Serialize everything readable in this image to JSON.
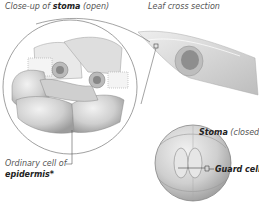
{
  "labels": {
    "closeup_prefix": "Close-up of ",
    "closeup_bold": "stoma",
    "closeup_suffix": " (open)",
    "leaf_cross_section": "Leaf cross section",
    "ordinary_cell": "Ordinary cell of",
    "epidermis": "epidermis*",
    "stoma_closed_bold": "Stoma",
    "stoma_closed_suffix": " (closed)",
    "guard_cells": "Guard cells"
  },
  "colors": {
    "cell_fill": "#d6d6d6",
    "cell_shadow": "#9a9a9a",
    "line": "#555555",
    "text": "#555555"
  }
}
